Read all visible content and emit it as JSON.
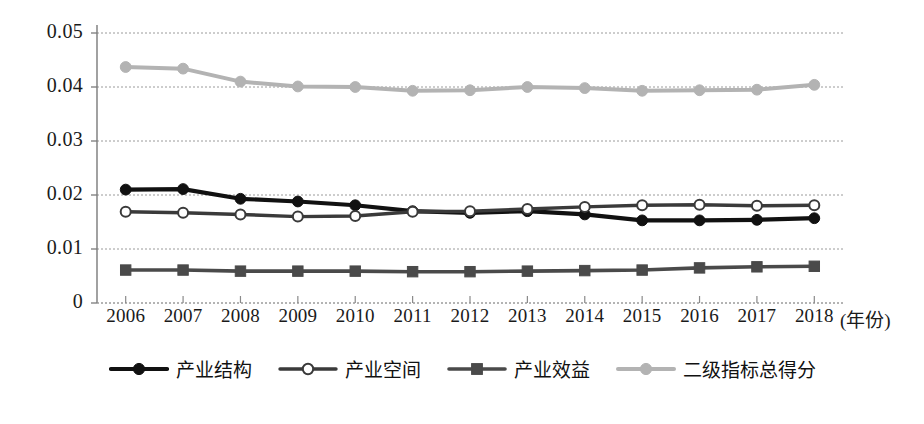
{
  "chart_data": {
    "type": "line",
    "title": "",
    "subtitle": "",
    "xlabel": "(年份)",
    "ylabel": "",
    "grid": true,
    "legend_position": "bottom",
    "xlim": [
      2006,
      2018
    ],
    "ylim": [
      0,
      0.05
    ],
    "ytick_labels": [
      "0.05",
      "0.04",
      "0.03",
      "0.02",
      "0.01",
      "0"
    ],
    "ytick_values": [
      0.05,
      0.04,
      0.03,
      0.02,
      0.01,
      0
    ],
    "categories": [
      "2006",
      "2007",
      "2008",
      "2009",
      "2010",
      "2011",
      "2012",
      "2013",
      "2014",
      "2015",
      "2016",
      "2017",
      "2018"
    ],
    "series": [
      {
        "name": "产业结构",
        "marker": "filled-circle",
        "color": "#111111",
        "values": [
          0.021,
          0.0211,
          0.0193,
          0.0188,
          0.0181,
          0.017,
          0.0167,
          0.017,
          0.0164,
          0.0153,
          0.0153,
          0.0154,
          0.0157
        ]
      },
      {
        "name": "产业空间",
        "marker": "hollow-circle",
        "color": "#3a3a3a",
        "values": [
          0.0169,
          0.0167,
          0.0164,
          0.016,
          0.0161,
          0.0169,
          0.017,
          0.0174,
          0.0178,
          0.0181,
          0.0182,
          0.018,
          0.0181
        ]
      },
      {
        "name": "产业效益",
        "marker": "filled-square",
        "color": "#4a4a4a",
        "values": [
          0.0061,
          0.0061,
          0.0059,
          0.0059,
          0.0059,
          0.0058,
          0.0058,
          0.0059,
          0.006,
          0.0061,
          0.0065,
          0.0067,
          0.0068
        ]
      },
      {
        "name": "二级指标总得分",
        "marker": "filled-circle",
        "color": "#b3b3b3",
        "values": [
          0.0437,
          0.0434,
          0.041,
          0.0401,
          0.04,
          0.0393,
          0.0394,
          0.04,
          0.0398,
          0.0393,
          0.0394,
          0.0395,
          0.0404
        ]
      }
    ]
  },
  "axis": {
    "x_title": "(年份)"
  },
  "legend": {
    "items": [
      {
        "label": "产业结构"
      },
      {
        "label": "产业空间"
      },
      {
        "label": "产业效益"
      },
      {
        "label": "二级指标总得分"
      }
    ]
  }
}
